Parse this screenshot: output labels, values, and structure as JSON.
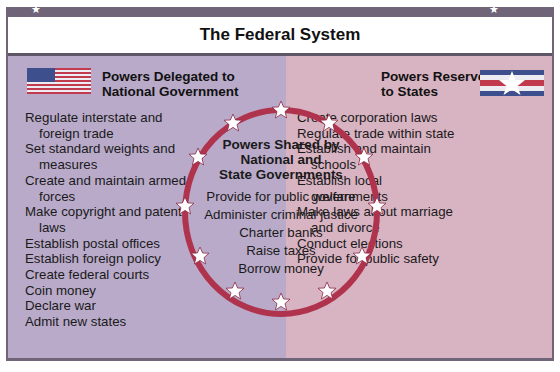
{
  "title": "The Federal System",
  "colors": {
    "frame": "#6f6478",
    "left_panel": "#b9aac9",
    "right_panel": "#d8b3c2",
    "ring": "#b0334e",
    "star": "#ffffff"
  },
  "icons": {
    "left_flag": "us-flag-icon",
    "right_flag": "state-flag-star-icon",
    "ring_star": "star-icon"
  },
  "left": {
    "header_line1": "Powers Delegated to",
    "header_line2": "National Government",
    "items": [
      "Regulate interstate and foreign trade",
      "Set standard weights and measures",
      "Create and maintain armed forces",
      "Make copyright and patent laws",
      "Establish postal offices",
      "Establish foreign policy",
      "Create federal courts",
      "Coin money",
      "Declare war",
      "Admit new states"
    ]
  },
  "right": {
    "header_line1": "Powers Reserved",
    "header_line2": "to States",
    "items": [
      "Create corporation laws",
      "Regulate trade within state",
      "Establish and maintain schools",
      "Establish local governments",
      "Make laws about marriage and divorce",
      "Conduct elections",
      "Provide for public safety"
    ]
  },
  "shared": {
    "header_line1": "Powers Shared by",
    "header_line2": "National and",
    "header_line3": "State Governments",
    "items": [
      "Provide for public welfare",
      "Administer criminal justice",
      "Charter banks",
      "Raise taxes",
      "Borrow money"
    ]
  }
}
